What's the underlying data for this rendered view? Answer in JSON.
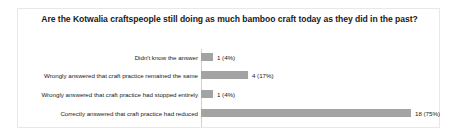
{
  "chart_data": {
    "type": "bar",
    "orientation": "horizontal",
    "title": "Are the Kotwalia craftspeople still doing as much bamboo craft today as they did in the past?",
    "xlabel": "",
    "ylabel": "",
    "grid": false,
    "legend": false,
    "xlim": [
      0,
      20
    ],
    "total_responses": 24,
    "bar_color": "#a3a3a3",
    "categories": [
      "Didn't know the answer",
      "Wrongly answered that craft practice remained the same",
      "Wrongly answered that craft practice had stopped entirely",
      "Correctly answered that craft practice had reduced"
    ],
    "values": [
      1,
      4,
      1,
      18
    ],
    "percentages": [
      "4%",
      "17%",
      "4%",
      "75%"
    ],
    "data_labels": [
      "1 (4%)",
      "4 (17%)",
      "1 (4%)",
      "18 (75%)"
    ]
  }
}
